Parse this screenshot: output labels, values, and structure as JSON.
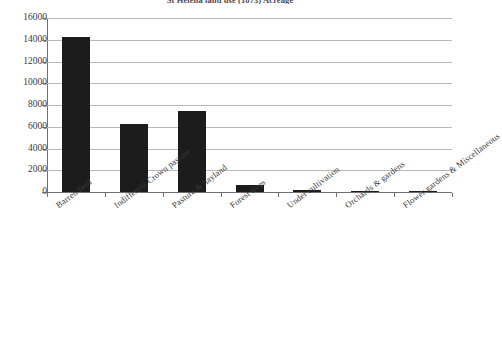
{
  "chart_data": {
    "type": "bar",
    "title": "St Helena land use (1873) Acreage",
    "xlabel": "",
    "ylabel": "",
    "ylim": [
      0,
      16000
    ],
    "ytick_step": 2000,
    "grid": true,
    "legend": "none",
    "categories": [
      "Barren land",
      "Indifferent Crown pasture",
      "Pasture & hayland",
      "Forest trees",
      "Under cultivation",
      "Orchards & gardens",
      "Flower gardens & Miscellaneous"
    ],
    "values": [
      14300,
      6250,
      7450,
      600,
      150,
      120,
      60
    ],
    "yticks": [
      0,
      2000,
      4000,
      6000,
      8000,
      10000,
      12000,
      14000,
      16000
    ],
    "ytick_labels": [
      "0",
      "2000",
      "4000",
      "6000",
      "8000",
      "10000",
      "12000",
      "14000",
      "16000"
    ],
    "bar_color": "#1c1c1c"
  }
}
